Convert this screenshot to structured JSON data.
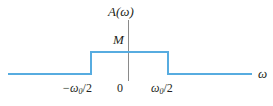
{
  "chart_data": {
    "type": "line",
    "title": "",
    "subtitle": "",
    "xlabel": "ω",
    "ylabel": "A(ω)",
    "grid": false,
    "legend": "none",
    "xlim": [
      -1.55,
      1.55
    ],
    "ylim": [
      0,
      1.3
    ],
    "x": [
      -1.55,
      -0.5,
      -0.5,
      0.5,
      0.5,
      1.55
    ],
    "y": [
      0,
      0,
      1,
      1,
      0,
      0
    ],
    "series": [
      {
        "name": "A(ω)",
        "values": [
          0,
          0,
          1,
          1,
          0,
          0
        ],
        "color": "#57ace0"
      }
    ],
    "xticks": [
      -0.5,
      0,
      0.5
    ],
    "xticklabels": [
      "−ω₀/2",
      "0",
      "ω₀/2"
    ],
    "yticks": [
      1
    ],
    "yticklabels": [
      "M"
    ],
    "annotations": [
      {
        "text": "M",
        "x": 0,
        "y": 1,
        "role": "amplitude-level"
      }
    ]
  },
  "axes": {
    "vertical_axis_name": "vertical-axis",
    "vertical_axis_color": "#8a8a8a",
    "horizontal_axis_color": "#57ace0"
  },
  "labels": {
    "y_axis": "A(ω)",
    "amplitude": "M",
    "x_axis": "ω",
    "tick_negative_main": "−ω",
    "tick_negative_sub": "0",
    "tick_negative_frac": "/2",
    "tick_zero": "0",
    "tick_positive_main": "ω",
    "tick_positive_sub": "0",
    "tick_positive_frac": "/2"
  },
  "colors": {
    "trace": "#57ace0",
    "axis": "#8a8a8a",
    "text": "#231f20",
    "background": "#ffffff"
  }
}
